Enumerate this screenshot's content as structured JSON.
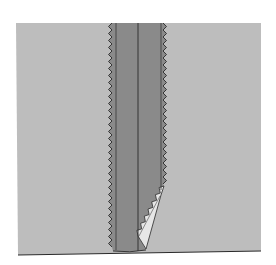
{
  "figure": {
    "colors": {
      "background": "#ffffff",
      "fabric": "#bdbdbd",
      "seam_allowance": "#8a8a8a",
      "underside_flap": "#e6e6e6",
      "outline": "#2a2a2a"
    },
    "parts": [
      "fabric-panel",
      "seam-allowance-strip",
      "center-seam-line",
      "left-stitch-line",
      "right-stitch-line",
      "left-pinked-edge",
      "right-pinked-edge",
      "curled-corner-flap"
    ]
  }
}
